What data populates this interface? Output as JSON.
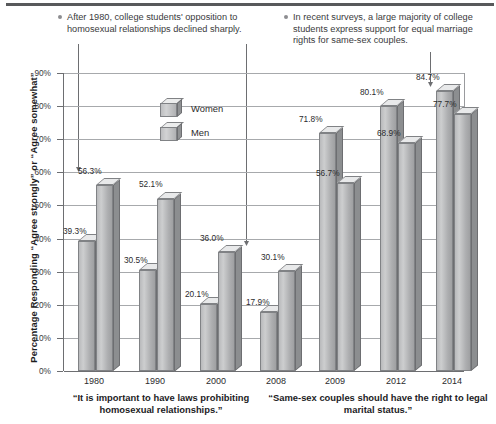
{
  "annotations": [
    {
      "id": "annotation-left",
      "text": "After 1980, college students' opposition to homosexual relationships declined sharply."
    },
    {
      "id": "annotation-right",
      "text": "In recent surveys, a large majority of college students express support for equal marriage rights for same-sex couples."
    }
  ],
  "legend": {
    "position": "inside-top-center",
    "entries": [
      {
        "label": "Women",
        "icon": "legend-box-3d"
      },
      {
        "label": "Men",
        "icon": "legend-box-3d"
      }
    ]
  },
  "groups": [
    {
      "caption": "“It is important to have laws prohibiting homosexual relationships.”"
    },
    {
      "caption": "“Same-sex couples should have the right to legal marital status.”"
    }
  ],
  "colors": {
    "bar_face": "#bcbdbf",
    "bar_top": "#e8e9ea",
    "bar_side": "#8c8e90",
    "bar_outline": "#808285",
    "gridline": "#a7a9ac",
    "axis": "#6d6e71",
    "text": "#231f20",
    "top_rule": "#58595b"
  },
  "chart_data": {
    "type": "bar",
    "title": "",
    "subtitle": "",
    "xlabel": "",
    "ylabel": "Percentage Responding “Agree strongly” or “Agree somewhat”",
    "ylim": [
      0,
      90
    ],
    "ytick_values": [
      0,
      10,
      20,
      30,
      40,
      50,
      60,
      70,
      80,
      90
    ],
    "ytick_labels": [
      "0%",
      "10%",
      "20%",
      "30%",
      "40%",
      "50%",
      "60%",
      "70%",
      "80%",
      "90%"
    ],
    "grid": true,
    "legend_position": "inside-top-center",
    "categories": [
      "1980",
      "1990",
      "2000",
      "2008",
      "2009",
      "2012",
      "2014"
    ],
    "series": [
      {
        "name": "Women",
        "values": [
          39.3,
          30.5,
          20.1,
          17.9,
          71.8,
          80.1,
          84.7
        ]
      },
      {
        "name": "Men",
        "values": [
          56.3,
          52.1,
          36.0,
          30.1,
          56.7,
          68.9,
          77.7
        ]
      }
    ],
    "data_labels": [
      {
        "category": "1980",
        "series": "Women",
        "label": "39.3%"
      },
      {
        "category": "1980",
        "series": "Men",
        "label": "56.3%"
      },
      {
        "category": "1990",
        "series": "Women",
        "label": "30.5%"
      },
      {
        "category": "1990",
        "series": "Men",
        "label": "52.1%"
      },
      {
        "category": "2000",
        "series": "Women",
        "label": "20.1%"
      },
      {
        "category": "2000",
        "series": "Men",
        "label": "36.0%"
      },
      {
        "category": "2008",
        "series": "Women",
        "label": "17.9%"
      },
      {
        "category": "2008",
        "series": "Men",
        "label": "30.1%"
      },
      {
        "category": "2009",
        "series": "Women",
        "label": "71.8%"
      },
      {
        "category": "2009",
        "series": "Men",
        "label": "56.7%"
      },
      {
        "category": "2012",
        "series": "Women",
        "label": "80.1%"
      },
      {
        "category": "2012",
        "series": "Men",
        "label": "68.9%"
      },
      {
        "category": "2014",
        "series": "Women",
        "label": "84.7%"
      },
      {
        "category": "2014",
        "series": "Men",
        "label": "77.7%"
      }
    ],
    "group_captions": [
      "“It is important to have laws prohibiting homosexual relationships.”",
      "“Same-sex couples should have the right to legal marital status.”"
    ],
    "annotations": [
      "After 1980, college students' opposition to homosexual relationships declined sharply.",
      "In recent surveys, a large majority of college students express support for equal marriage rights for same-sex couples."
    ]
  }
}
